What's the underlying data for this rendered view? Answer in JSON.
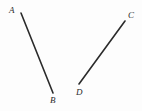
{
  "figure": {
    "width": 142,
    "height": 111,
    "background_color": "#fdfdfd",
    "stroke_color": "#2b2b2b",
    "stroke_width": 1.6,
    "label_color": "#2b2b2b",
    "segments": [
      {
        "name": "segment-ab",
        "from_label": "A",
        "to_label": "B",
        "x1": 21,
        "y1": 13,
        "x2": 53,
        "y2": 93
      },
      {
        "name": "segment-cd",
        "from_label": "C",
        "to_label": "D",
        "x1": 79,
        "y1": 84,
        "x2": 125,
        "y2": 21
      }
    ],
    "labels": [
      {
        "name": "label-a",
        "text": "A",
        "x": 9,
        "y": 6
      },
      {
        "name": "label-b",
        "text": "B",
        "x": 50,
        "y": 96
      },
      {
        "name": "label-c",
        "text": "C",
        "x": 128,
        "y": 11
      },
      {
        "name": "label-d",
        "text": "D",
        "x": 76,
        "y": 88
      }
    ]
  }
}
